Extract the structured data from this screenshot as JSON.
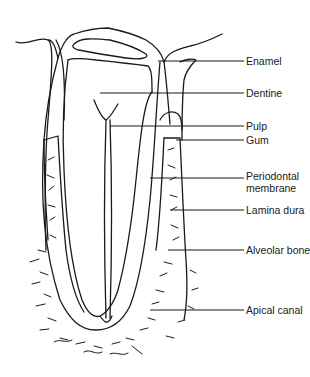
{
  "figure": {
    "type": "longitudinal section of a tooth in its socket",
    "labels": [
      {
        "id": "enamel",
        "text": "Enamel"
      },
      {
        "id": "dentine",
        "text": "Dentine"
      },
      {
        "id": "pulp",
        "text": "Pulp"
      },
      {
        "id": "gum",
        "text": "Gum"
      },
      {
        "id": "periodontal-membrane",
        "text": "Periodontal\nmembrane",
        "line1": "Periodontal",
        "line2": "membrane"
      },
      {
        "id": "lamina-dura",
        "text": "Lamina dura"
      },
      {
        "id": "alveolar-bone",
        "text": "Alveolar bone"
      },
      {
        "id": "apical-canal",
        "text": "Apical canal"
      }
    ],
    "colors": {
      "ink": "#1a1a1a",
      "background": "#ffffff"
    }
  }
}
